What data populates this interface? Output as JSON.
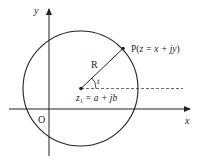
{
  "diagram": {
    "type": "complex-plane-circle",
    "axes": {
      "x_label": "x",
      "y_label": "y",
      "origin_label": "O"
    },
    "circle": {
      "center_label": "z₁ = a + jb",
      "center_var": "z",
      "center_sub": "1",
      "center_rest": " = a + jb",
      "radius_label": "R",
      "angle_label": "t"
    },
    "point": {
      "label_prefix": "P(",
      "label_expr": "z = x + jy",
      "label_suffix": ")"
    },
    "colors": {
      "stroke": "#222222",
      "dash": "#444444",
      "background": "#ffffff"
    }
  }
}
